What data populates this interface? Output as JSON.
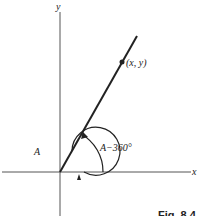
{
  "figure": {
    "caption": "Fig. 8.4",
    "axes": {
      "x_label": "x",
      "y_label": "y"
    },
    "point_label": "(x, y)",
    "angle_labels": {
      "full_angle": "A",
      "reduced_angle": "A−360°"
    },
    "colors": {
      "stroke": "#222222",
      "axis": "#555555",
      "background": "#ffffff"
    }
  }
}
